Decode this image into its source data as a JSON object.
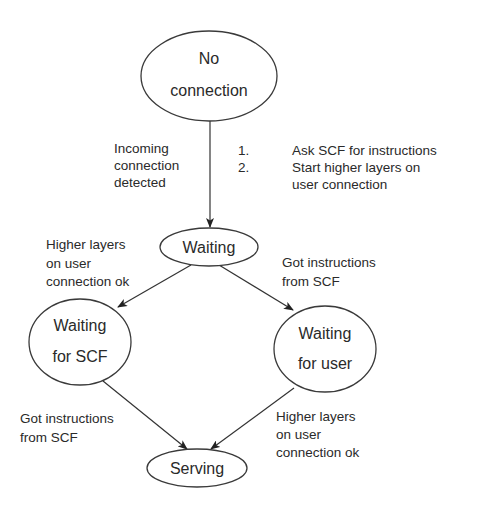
{
  "diagram": {
    "type": "state-transition",
    "states": {
      "no_connection": {
        "line1": "No",
        "line2": "connection"
      },
      "waiting": {
        "label": "Waiting"
      },
      "waiting_for_scf": {
        "line1": "Waiting",
        "line2": "for SCF"
      },
      "waiting_for_user": {
        "line1": "Waiting",
        "line2": "for user"
      },
      "serving": {
        "label": "Serving"
      }
    },
    "transitions": {
      "incoming": {
        "from": "No connection",
        "to": "Waiting",
        "condition": [
          "Incoming",
          "connection",
          "detected"
        ],
        "actions": {
          "item1_num": "1.",
          "item1_text": "Ask SCF for instructions",
          "item2_num": "2.",
          "item2_text_line1": "Start higher layers on",
          "item2_text_line2": "user connection"
        }
      },
      "waiting_to_scf": {
        "from": "Waiting",
        "to": "Waiting for SCF",
        "condition": [
          "Higher layers",
          "on user",
          "connection ok"
        ]
      },
      "waiting_to_user": {
        "from": "Waiting",
        "to": "Waiting for user",
        "condition": [
          "Got instructions",
          "from SCF"
        ]
      },
      "scf_to_serving": {
        "from": "Waiting for SCF",
        "to": "Serving",
        "condition": [
          "Got instructions",
          "from SCF"
        ]
      },
      "user_to_serving": {
        "from": "Waiting for user",
        "to": "Serving",
        "condition": [
          "Higher layers",
          "on user",
          "connection ok"
        ]
      }
    },
    "colors": {
      "background": "#ffffff",
      "stroke": "#333333",
      "text": "#2a2a2a"
    }
  }
}
